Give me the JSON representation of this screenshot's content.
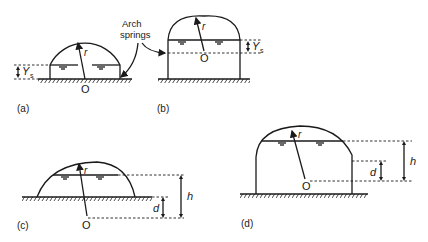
{
  "figure": {
    "annotation": "Arch springs",
    "panels": [
      {
        "id": "a",
        "label": "(a)",
        "radius_label": "r",
        "center_label": "O",
        "dim_label": "Y",
        "dim_sub": "s"
      },
      {
        "id": "b",
        "label": "(b)",
        "radius_label": "r",
        "center_label": "O",
        "dim_label": "Y",
        "dim_sub": "s"
      },
      {
        "id": "c",
        "label": "(c)",
        "radius_label": "r",
        "center_label": "O",
        "dim_d": "d",
        "dim_h": "h"
      },
      {
        "id": "d",
        "label": "(d)",
        "radius_label": "r",
        "center_label": "O",
        "dim_d": "d",
        "dim_h": "h"
      }
    ]
  },
  "colors": {
    "ink": "#1a1a1a",
    "background": "#ffffff"
  }
}
